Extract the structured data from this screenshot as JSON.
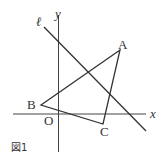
{
  "figure": {
    "caption": "図1",
    "axes": {
      "x_label": "x",
      "y_label": "y",
      "origin_label": "O"
    },
    "line_label": "ℓ",
    "points": {
      "A": "A",
      "B": "B",
      "C": "C"
    },
    "colors": {
      "stroke": "#333333",
      "background": "#ffffff"
    }
  }
}
